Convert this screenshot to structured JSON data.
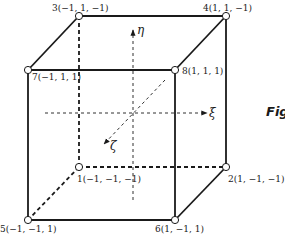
{
  "diagram": {
    "type": "hexahedral-element-natural-coordinates",
    "caption_fragment": "Fig",
    "axes": {
      "eta": "η",
      "xi": "ξ",
      "zeta": "ζ"
    },
    "nodes": [
      {
        "id": 1,
        "label": "1(−1, −1, −1)",
        "coords": [
          -1,
          -1,
          -1
        ]
      },
      {
        "id": 2,
        "label": "2(1, −1, −1)",
        "coords": [
          1,
          -1,
          -1
        ]
      },
      {
        "id": 3,
        "label": "3(−1, 1, −1)",
        "coords": [
          -1,
          1,
          -1
        ]
      },
      {
        "id": 4,
        "label": "4(1, 1, −1)",
        "coords": [
          1,
          1,
          -1
        ]
      },
      {
        "id": 5,
        "label": "5(−1, −1, 1)",
        "coords": [
          -1,
          -1,
          1
        ]
      },
      {
        "id": 6,
        "label": "6(1, −1, 1)",
        "coords": [
          1,
          -1,
          1
        ]
      },
      {
        "id": 7,
        "label": "7(−1, 1, 1)",
        "coords": [
          -1,
          1,
          1
        ]
      },
      {
        "id": 8,
        "label": "8(1, 1, 1)",
        "coords": [
          1,
          1,
          1
        ]
      }
    ],
    "colors": {
      "stroke": "#1a1a1a",
      "node_fill": "#ffffff"
    }
  }
}
